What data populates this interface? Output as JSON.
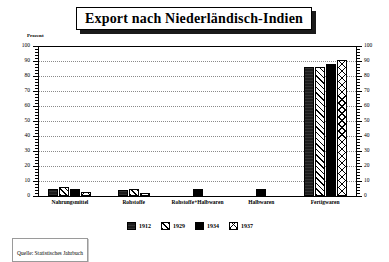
{
  "title": "Export nach Niederländisch-Indien",
  "source": {
    "label": "Quelle: Statistisches Jahrbuch"
  },
  "axis": {
    "y_unit_label": "Prozent",
    "y_ticks": [
      "0",
      "10",
      "20",
      "30",
      "40",
      "50",
      "60",
      "70",
      "80",
      "90",
      "100"
    ]
  },
  "legend": {
    "items": [
      {
        "label": "1912",
        "pattern": "dark-solid",
        "color": "#1c1c1c"
      },
      {
        "label": "1929",
        "pattern": "diagonal-hatch",
        "color": "#ffffff"
      },
      {
        "label": "1934",
        "pattern": "solid-black",
        "color": "#000000"
      },
      {
        "label": "1937",
        "pattern": "cross-hatch-x",
        "color": "#ffffff"
      }
    ]
  },
  "chart_data": {
    "type": "bar",
    "title": "Export nach Niederländisch-Indien",
    "xlabel": "",
    "ylabel": "Prozent",
    "ylim": [
      0,
      100
    ],
    "ytick_step": 10,
    "grid": true,
    "legend_position": "bottom",
    "categories": [
      "Nahrungsmittel",
      "Rohstoffe",
      "Rohstoffe+Halbwaren",
      "Halbwaren",
      "Fertigwaren"
    ],
    "series": [
      {
        "name": "1912",
        "values": [
          5,
          4,
          null,
          null,
          86
        ]
      },
      {
        "name": "1929",
        "values": [
          6,
          5,
          null,
          null,
          86
        ]
      },
      {
        "name": "1934",
        "values": [
          5,
          null,
          5,
          5,
          88
        ]
      },
      {
        "name": "1937",
        "values": [
          3,
          2,
          null,
          null,
          91
        ]
      }
    ],
    "annotations": [
      "Quelle: Statistisches Jahrbuch"
    ]
  }
}
